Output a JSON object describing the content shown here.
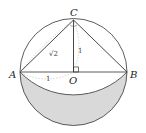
{
  "diagram": {
    "points": {
      "A": "A",
      "B": "B",
      "C": "C",
      "O": "O"
    },
    "measures": {
      "AC": "√2",
      "CO": "1",
      "AO": "1"
    },
    "colors": {
      "stroke": "#333333",
      "shade": "#d9d9d9",
      "dashed": "#aaaaaa"
    }
  }
}
